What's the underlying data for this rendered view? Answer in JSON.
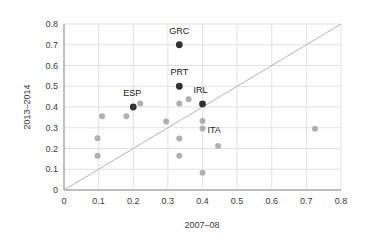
{
  "chart_data": {
    "type": "scatter",
    "title": "",
    "xlabel": "2007–08",
    "ylabel": "2013–2014",
    "xlim": [
      0,
      0.8
    ],
    "ylim": [
      0,
      0.8
    ],
    "xticks": [
      "0",
      "0.1",
      "0.2",
      "0.3",
      "0.4",
      "0.5",
      "0.6",
      "0.7",
      "0.8"
    ],
    "xtick_values": [
      0,
      0.1,
      0.2,
      0.3,
      0.4,
      0.5,
      0.6,
      0.7,
      0.8
    ],
    "yticks": [
      "0",
      "0.1",
      "0.2",
      "0.3",
      "0.4",
      "0.5",
      "0.6",
      "0.7",
      "0.8"
    ],
    "ytick_values": [
      0,
      0.1,
      0.2,
      0.3,
      0.4,
      0.5,
      0.6,
      0.7,
      0.8
    ],
    "grid": true,
    "legend": "none",
    "reference_line": {
      "name": "identity-line",
      "from": [
        0,
        0
      ],
      "to": [
        0.8,
        0.8
      ],
      "color": "#b4b4b4"
    },
    "colors": {
      "highlight": "#333333",
      "normal": "#b0b0b0",
      "grid": "#e2e2e2",
      "axis": "#8c8c8c",
      "text": "#3c3c3c",
      "label": "#1a1a1a"
    },
    "series": [
      {
        "name": "Highlighted countries",
        "color": "#333333",
        "points": [
          {
            "label": "GRC",
            "x": 0.333,
            "y": 0.7,
            "label_dx": 0,
            "label_dy": -9
          },
          {
            "label": "PRT",
            "x": 0.333,
            "y": 0.5,
            "label_dx": 0,
            "label_dy": -9
          },
          {
            "label": "ESP",
            "x": 0.2,
            "y": 0.4,
            "label_dx": -1,
            "label_dy": -9
          },
          {
            "label": "IRL",
            "x": 0.4,
            "y": 0.415,
            "label_dx": -2,
            "label_dy": -9
          }
        ]
      },
      {
        "name": "Other countries",
        "color": "#b0b0b0",
        "points": [
          {
            "label": "",
            "x": 0.11,
            "y": 0.356,
            "label_dx": 0,
            "label_dy": 0
          },
          {
            "label": "",
            "x": 0.097,
            "y": 0.25,
            "label_dx": 0,
            "label_dy": 0
          },
          {
            "label": "",
            "x": 0.097,
            "y": 0.165,
            "label_dx": 0,
            "label_dy": 0
          },
          {
            "label": "",
            "x": 0.18,
            "y": 0.356,
            "label_dx": 0,
            "label_dy": 0
          },
          {
            "label": "",
            "x": 0.22,
            "y": 0.417,
            "label_dx": 0,
            "label_dy": 0
          },
          {
            "label": "",
            "x": 0.295,
            "y": 0.33,
            "label_dx": 0,
            "label_dy": 0
          },
          {
            "label": "",
            "x": 0.333,
            "y": 0.417,
            "label_dx": 0,
            "label_dy": 0
          },
          {
            "label": "",
            "x": 0.333,
            "y": 0.248,
            "label_dx": 0,
            "label_dy": 0
          },
          {
            "label": "",
            "x": 0.333,
            "y": 0.165,
            "label_dx": 0,
            "label_dy": 0
          },
          {
            "label": "",
            "x": 0.36,
            "y": 0.437,
            "label_dx": 0,
            "label_dy": 0
          },
          {
            "label": "",
            "x": 0.4,
            "y": 0.333,
            "label_dx": 0,
            "label_dy": 0
          },
          {
            "label": "",
            "x": 0.4,
            "y": 0.296,
            "label_dx": 0,
            "label_dy": 0
          },
          {
            "label": "",
            "x": 0.4,
            "y": 0.083,
            "label_dx": 0,
            "label_dy": 0
          },
          {
            "label": "ITA",
            "x": 0.445,
            "y": 0.212,
            "label_dx": -4,
            "label_dy": -11
          },
          {
            "label": "",
            "x": 0.725,
            "y": 0.295,
            "label_dx": 0,
            "label_dy": 0
          }
        ]
      }
    ]
  }
}
